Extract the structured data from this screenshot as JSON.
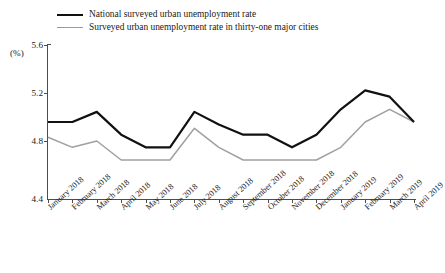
{
  "legend": {
    "position": "top-left",
    "items": [
      {
        "label": "National surveyed urban unemployment rate",
        "color": "#111111",
        "style": "thick-solid"
      },
      {
        "label": "Surveyed urban unemployment rate in thirty-one major cities",
        "color": "#9a9a9a",
        "style": "thin-solid"
      }
    ]
  },
  "axis": {
    "unit_label": "(%)",
    "y_ticks": [
      "5.6",
      "5.2",
      "4.8",
      "4.4"
    ]
  },
  "chart_data": {
    "type": "line",
    "title": "",
    "subtitle": "",
    "xlabel": "",
    "ylabel": "(%)",
    "ylim": [
      4.4,
      5.6
    ],
    "yticks": [
      4.4,
      4.8,
      5.2,
      5.6
    ],
    "grid": false,
    "legend_position": "top-left",
    "categories": [
      "January 2018",
      "February 2018",
      "March 2018",
      "April 2018",
      "May 2018",
      "June 2018",
      "July 2018",
      "August 2018",
      "September 2018",
      "October 2018",
      "November 2018",
      "December 2018",
      "January 2019",
      "February 2019",
      "March 2019",
      "April 2019"
    ],
    "series": [
      {
        "name": "National surveyed urban unemployment rate",
        "color": "#111111",
        "values": [
          5.0,
          5.0,
          5.08,
          4.9,
          4.8,
          4.8,
          5.08,
          4.98,
          4.9,
          4.9,
          4.8,
          4.9,
          5.1,
          5.25,
          5.2,
          5.0
        ]
      },
      {
        "name": "Surveyed urban unemployment rate in thirty-one major cities",
        "color": "#9a9a9a",
        "values": [
          4.88,
          4.8,
          4.85,
          4.7,
          4.7,
          4.7,
          4.95,
          4.8,
          4.7,
          4.7,
          4.7,
          4.7,
          4.8,
          5.0,
          5.1,
          5.0
        ]
      }
    ]
  }
}
